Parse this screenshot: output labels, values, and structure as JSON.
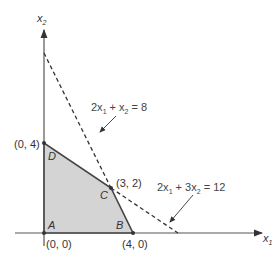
{
  "diagram": {
    "type": "linear-programming-feasible-region",
    "axes": {
      "x_label": "x",
      "x_sub": "1",
      "y_label": "x",
      "y_sub": "2"
    },
    "vertices": [
      {
        "name": "A",
        "coord": "(0, 0)"
      },
      {
        "name": "B",
        "coord": "(4, 0)"
      },
      {
        "name": "C",
        "coord": "(3, 2)"
      },
      {
        "name": "D",
        "coord": "(0, 4)"
      }
    ],
    "constraints": [
      {
        "label_parts": [
          "2x",
          "1",
          " + x",
          "2",
          " = 8"
        ],
        "text": "2x1 + x2 = 8"
      },
      {
        "label_parts": [
          "2x",
          "1",
          " + 3x",
          "2",
          " = 12"
        ],
        "text": "2x1 + 3x2 = 12"
      }
    ],
    "colors": {
      "feasible_fill": "#d4d4d4",
      "lines": "#333333",
      "axes": "#555555"
    }
  }
}
